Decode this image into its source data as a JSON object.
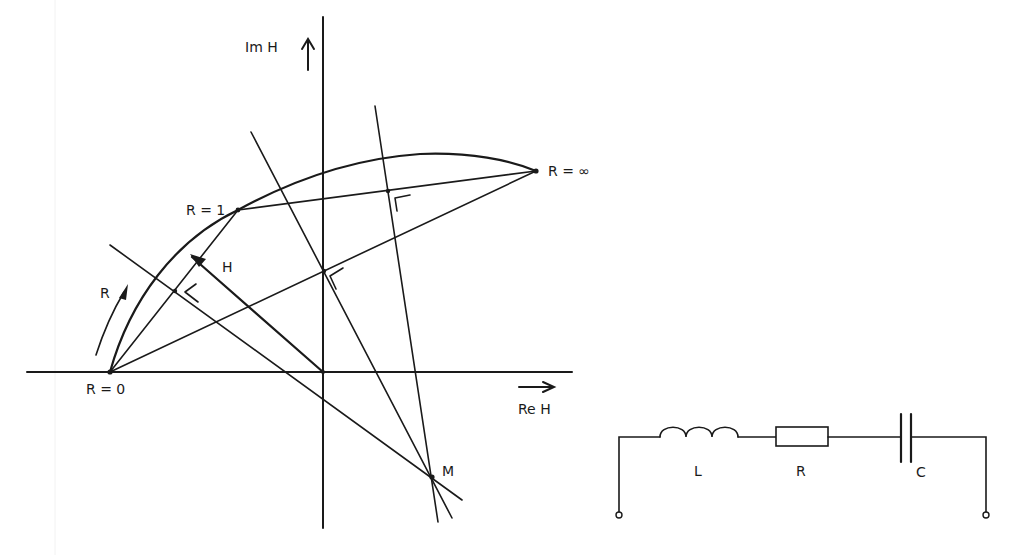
{
  "diagram": {
    "type": "locus-diagram",
    "colors": {
      "ink": "#1a1a1a",
      "background": "#ffffff"
    }
  },
  "axes": {
    "imaginary_label": "Im H",
    "real_label": "Re H",
    "imaginary_arrow_icon": "arrow-up",
    "real_arrow_icon": "arrow-right"
  },
  "points": {
    "r_zero": "R = 0",
    "r_one": "R = 1",
    "r_infinity": "R = ∞",
    "center": "M"
  },
  "vector": {
    "label": "H"
  },
  "direction": {
    "label": "R",
    "meaning": "direction of increasing R along the locus"
  },
  "circuit": {
    "components": [
      {
        "symbol": "inductor",
        "label": "L"
      },
      {
        "symbol": "resistor",
        "label": "R"
      },
      {
        "symbol": "capacitor",
        "label": "C"
      }
    ],
    "terminals": 2
  },
  "geometry": {
    "origin": [
      323,
      372
    ],
    "r0": [
      110,
      372
    ],
    "r1": [
      238,
      210
    ],
    "rinf": [
      536,
      171
    ],
    "m": [
      432,
      477
    ]
  }
}
